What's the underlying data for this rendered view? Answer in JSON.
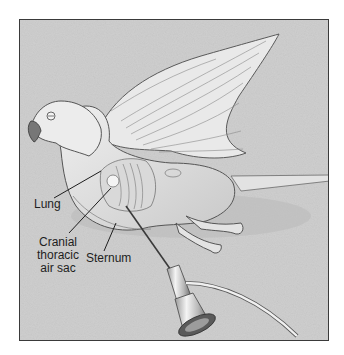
{
  "figure": {
    "labels": {
      "lung": "Lung",
      "cranial_thoracic_air_sac_line1": "Cranial",
      "cranial_thoracic_air_sac_line2": "thoracic",
      "cranial_thoracic_air_sac_line3": "air sac",
      "sternum": "Sternum"
    },
    "colors": {
      "background": "#cfcfcf",
      "frame_border": "#3a3a3a",
      "bird_body": "#e6e6e6",
      "outline": "#555555",
      "label_text": "#1e1e1e"
    }
  }
}
